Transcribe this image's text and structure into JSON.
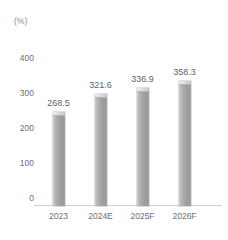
{
  "chart_data": {
    "type": "bar",
    "title": "",
    "subtitle": "",
    "xlabel": "",
    "ylabel": "(%)",
    "unit_label": "(%)",
    "categories": [
      "2023",
      "2024E",
      "2025F",
      "2026F"
    ],
    "values": [
      268.5,
      321.6,
      336.9,
      358.3
    ],
    "value_labels": [
      "268.5",
      "321.6",
      "336.9",
      "358.3"
    ],
    "yticks": [
      400,
      300,
      200,
      100,
      0
    ],
    "ytick_labels": [
      "400",
      "300",
      "200",
      "100",
      "0"
    ],
    "ylim": [
      0,
      430
    ],
    "grid": false,
    "legend": null,
    "series": [
      {
        "name": "",
        "values": [
          268.5,
          321.6,
          336.9,
          358.3
        ]
      }
    ],
    "colors": {
      "bar_light": "#cfcfcf",
      "bar_mid": "#a8a8a8",
      "bar_dark": "#9a9a9a",
      "bar_cap": "#e4e4e4",
      "axis": "#cfcfcf",
      "tick_text": "#6f6f6f",
      "value_text": "#5f5f5f",
      "background": "#ffffff"
    }
  },
  "artifacts": {
    "top_fragment_1": "",
    "top_fragment_2": "",
    "top_fragment_3": ""
  }
}
